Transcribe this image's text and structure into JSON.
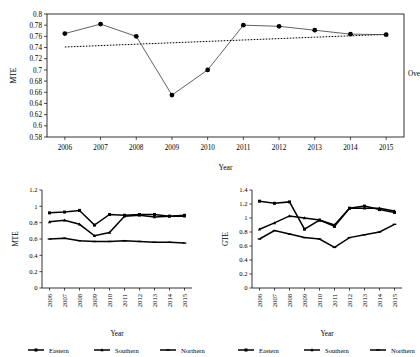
{
  "figure": {
    "panels": [
      "overall-mte",
      "regional-mte",
      "regional-gte"
    ]
  },
  "side_annotation": "Overall",
  "legend": {
    "items": [
      {
        "label": "Eastern",
        "marker": "square"
      },
      {
        "label": "Southern",
        "marker": "triangle"
      },
      {
        "label": "Northern",
        "marker": "dash"
      }
    ]
  },
  "chart_data": [
    {
      "id": "overall-mte",
      "type": "line",
      "title": "",
      "xlabel": "Year",
      "ylabel": "MTE",
      "x": [
        "2006",
        "2007",
        "2008",
        "2009",
        "2010",
        "2011",
        "2012",
        "2013",
        "2014",
        "2015"
      ],
      "categories": [
        "2006",
        "2007",
        "2008",
        "2009",
        "2010",
        "2011",
        "2012",
        "2013",
        "2014",
        "2015"
      ],
      "ylim": [
        0.58,
        0.8
      ],
      "yticks": [
        "0.58",
        "0.6",
        "0.62",
        "0.64",
        "0.66",
        "0.68",
        "0.7",
        "0.72",
        "0.74",
        "0.76",
        "0.78",
        "0.8"
      ],
      "ytick_values": [
        0.58,
        0.6,
        0.62,
        0.64,
        0.66,
        0.68,
        0.7,
        0.72,
        0.74,
        0.76,
        0.78,
        0.8
      ],
      "grid": false,
      "legend_position": "none",
      "series": [
        {
          "name": "Overall MTE",
          "style": "solid-with-round-markers",
          "values": [
            0.765,
            0.782,
            0.76,
            0.655,
            0.7,
            0.78,
            0.778,
            0.771,
            0.764,
            0.763
          ]
        },
        {
          "name": "Trend",
          "style": "dotted",
          "values": [
            0.741,
            0.7435,
            0.746,
            0.7485,
            0.751,
            0.7535,
            0.756,
            0.7585,
            0.761,
            0.7635
          ]
        }
      ],
      "annotation": "Overall"
    },
    {
      "id": "regional-mte",
      "type": "line",
      "title": "",
      "xlabel": "Year",
      "ylabel": "MTE",
      "x": [
        "2006",
        "2007",
        "2008",
        "2009",
        "2010",
        "2011",
        "2012",
        "2013",
        "2014",
        "2015"
      ],
      "categories": [
        "2006",
        "2007",
        "2008",
        "2009",
        "2010",
        "2011",
        "2012",
        "2013",
        "2014",
        "2015"
      ],
      "ylim": [
        0,
        1.2
      ],
      "yticks": [
        "0",
        "0.2",
        "0.4",
        "0.6",
        "0.8",
        "1",
        "1.2"
      ],
      "ytick_values": [
        0,
        0.2,
        0.4,
        0.6,
        0.8,
        1.0,
        1.2
      ],
      "grid": false,
      "legend_position": "bottom",
      "series": [
        {
          "name": "Eastern",
          "values": [
            0.92,
            0.93,
            0.95,
            0.77,
            0.9,
            0.89,
            0.9,
            0.9,
            0.88,
            0.89
          ]
        },
        {
          "name": "Southern",
          "values": [
            0.81,
            0.83,
            0.78,
            0.64,
            0.68,
            0.88,
            0.89,
            0.87,
            0.88,
            0.88
          ]
        },
        {
          "name": "Northern",
          "values": [
            0.6,
            0.61,
            0.58,
            0.57,
            0.57,
            0.58,
            0.57,
            0.56,
            0.56,
            0.55
          ]
        }
      ]
    },
    {
      "id": "regional-gte",
      "type": "line",
      "title": "",
      "xlabel": "Year",
      "ylabel": "GTE",
      "x": [
        "2006",
        "2007",
        "2008",
        "2009",
        "2010",
        "2011",
        "2012",
        "2013",
        "2014",
        "2015"
      ],
      "categories": [
        "2006",
        "2007",
        "2008",
        "2009",
        "2010",
        "2011",
        "2012",
        "2013",
        "2014",
        "2015"
      ],
      "ylim": [
        0,
        1.4
      ],
      "yticks": [
        "0",
        "0.2",
        "0.4",
        "0.6",
        "0.8",
        "1",
        "1.2",
        "1.4"
      ],
      "ytick_values": [
        0,
        0.2,
        0.4,
        0.6,
        0.8,
        1.0,
        1.2,
        1.4
      ],
      "grid": false,
      "legend_position": "bottom",
      "series": [
        {
          "name": "Eastern",
          "values": [
            1.24,
            1.21,
            1.23,
            0.84,
            0.97,
            0.88,
            1.14,
            1.17,
            1.12,
            1.08
          ]
        },
        {
          "name": "Southern",
          "values": [
            0.84,
            0.93,
            1.03,
            1.0,
            0.97,
            0.9,
            1.14,
            1.14,
            1.14,
            1.1
          ]
        },
        {
          "name": "Northern",
          "values": [
            0.7,
            0.82,
            0.77,
            0.72,
            0.7,
            0.58,
            0.72,
            0.76,
            0.8,
            0.91
          ]
        }
      ]
    }
  ]
}
